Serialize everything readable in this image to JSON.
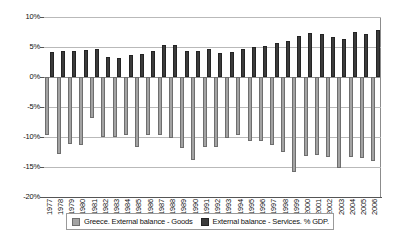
{
  "chart_data": {
    "type": "bar",
    "title": "",
    "subtitle": "",
    "xlabel": "",
    "ylabel": "",
    "ylim": [
      -20,
      10
    ],
    "ytick_labels": [
      "10%",
      "5%",
      "0%",
      "-5%",
      "-10%",
      "-15%",
      "-20%"
    ],
    "ytick_values": [
      10,
      5,
      0,
      -5,
      -10,
      -15,
      -20
    ],
    "grid": true,
    "legend_position": "bottom",
    "categories": [
      "1977",
      "1978",
      "1979",
      "1980",
      "1981",
      "1982",
      "1983",
      "1984",
      "1985",
      "1986",
      "1987",
      "1988",
      "1989",
      "1990",
      "1991",
      "1992",
      "1993",
      "1994",
      "1995",
      "1996",
      "1997",
      "1998",
      "1999",
      "2000",
      "2001",
      "2002",
      "2003",
      "2004",
      "2005",
      "2006"
    ],
    "series": [
      {
        "name": "Greece. External balance - Goods",
        "color": "#a3a3a3",
        "values": [
          -9.7,
          -12.8,
          -11.2,
          -11.3,
          -6.8,
          -10.0,
          -10.0,
          -9.6,
          -11.6,
          -9.7,
          -9.6,
          -10.1,
          -11.8,
          -13.9,
          -11.7,
          -11.7,
          -10.2,
          -9.7,
          -10.6,
          -10.7,
          -11.3,
          -12.5,
          -15.8,
          -13.2,
          -13.0,
          -13.3,
          -15.1,
          -13.4,
          -13.5,
          -14.0
        ]
      },
      {
        "name": "External balance - Services. % GDP.",
        "color": "#3b3b3b",
        "values": [
          4.1,
          4.4,
          4.3,
          4.5,
          4.7,
          3.4,
          3.1,
          3.7,
          3.9,
          4.4,
          5.4,
          5.3,
          4.3,
          4.4,
          4.6,
          4.0,
          4.2,
          4.7,
          5.0,
          5.1,
          5.7,
          6.0,
          6.8,
          7.4,
          7.1,
          6.7,
          6.4,
          7.5,
          7.2,
          7.9
        ]
      }
    ]
  },
  "legend": {
    "items": [
      {
        "label": "Greece. External balance - Goods",
        "swatch": "goods"
      },
      {
        "label": "External balance - Services. % GDP.",
        "swatch": "services"
      }
    ]
  }
}
